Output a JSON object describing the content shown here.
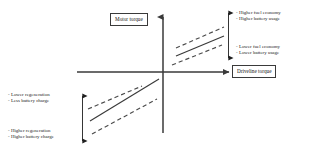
{
  "diagram": {
    "axes": {
      "vertical": {
        "label": "Motor torque",
        "icon": "up-arrow-icon"
      },
      "horizontal": {
        "label": "Driveline torque",
        "icon": "right-arrow-icon"
      }
    },
    "annotations": [
      {
        "id": "top-right",
        "quadrant": "I",
        "position": "upper",
        "lines": [
          "- Higher fuel economy",
          "- Higher battery usage"
        ]
      },
      {
        "id": "bottom-right",
        "quadrant": "I",
        "position": "lower",
        "lines": [
          "- Lower fuel economy",
          "- Lower battery usage"
        ]
      },
      {
        "id": "middle-left",
        "quadrant": "III",
        "position": "upper",
        "lines": [
          "- Lower regeneration",
          "- Less battery charge"
        ]
      },
      {
        "id": "bottom-left",
        "quadrant": "III",
        "position": "lower",
        "lines": [
          "- Higher regeneration",
          "- Higher battery charge"
        ]
      }
    ],
    "range_arrows": [
      {
        "id": "right-range-arrow",
        "orientation": "vertical",
        "heads": "both"
      },
      {
        "id": "left-range-arrow",
        "orientation": "vertical",
        "heads": "both"
      }
    ],
    "curves": [
      {
        "id": "q1-upper-bound",
        "quadrant": "I",
        "style": "dashed"
      },
      {
        "id": "q1-nominal",
        "quadrant": "I",
        "style": "solid"
      },
      {
        "id": "q1-lower-bound",
        "quadrant": "I",
        "style": "dashed"
      },
      {
        "id": "q3-upper-bound",
        "quadrant": "III",
        "style": "dashed"
      },
      {
        "id": "q3-nominal",
        "quadrant": "III",
        "style": "solid"
      },
      {
        "id": "q3-lower-bound",
        "quadrant": "III",
        "style": "dashed"
      }
    ],
    "colors": {
      "axis": "#3a3a3a",
      "curve": "#3a3a3a",
      "text": "#1a1a1a",
      "background": "#ffffff"
    }
  }
}
